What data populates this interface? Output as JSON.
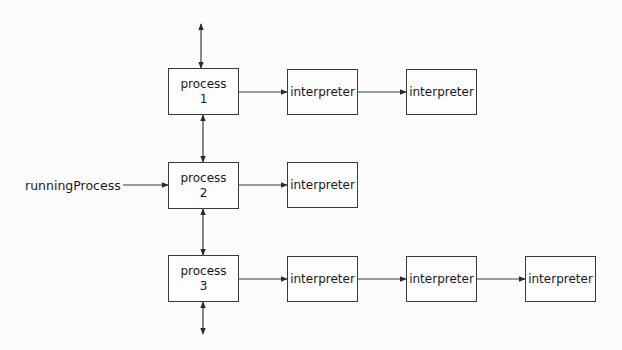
{
  "diagram": {
    "external_input": {
      "label": "runningProcess",
      "target": "process-2"
    },
    "processes": [
      {
        "id": "process-1",
        "title": "process",
        "number": "1",
        "interpreters": [
          "interpreter",
          "interpreter"
        ]
      },
      {
        "id": "process-2",
        "title": "process",
        "number": "2",
        "interpreters": [
          "interpreter"
        ]
      },
      {
        "id": "process-3",
        "title": "process",
        "number": "3",
        "interpreters": [
          "interpreter",
          "interpreter",
          "interpreter"
        ]
      }
    ],
    "links": [
      {
        "from": "above",
        "to": "process-1",
        "style": "bidirectional"
      },
      {
        "from": "process-1",
        "to": "process-2",
        "style": "bidirectional"
      },
      {
        "from": "process-2",
        "to": "process-3",
        "style": "bidirectional"
      },
      {
        "from": "process-3",
        "to": "below",
        "style": "bidirectional"
      },
      {
        "from": "runningProcess",
        "to": "process-2",
        "style": "directed"
      },
      {
        "from": "process-1",
        "to": "interpreter-1-1",
        "style": "directed"
      },
      {
        "from": "interpreter-1-1",
        "to": "interpreter-1-2",
        "style": "directed"
      },
      {
        "from": "process-2",
        "to": "interpreter-2-1",
        "style": "directed"
      },
      {
        "from": "process-3",
        "to": "interpreter-3-1",
        "style": "directed"
      },
      {
        "from": "interpreter-3-1",
        "to": "interpreter-3-2",
        "style": "directed"
      },
      {
        "from": "interpreter-3-2",
        "to": "interpreter-3-3",
        "style": "directed"
      }
    ],
    "colors": {
      "stroke": "#3a3a3a",
      "background": "#fcfcfc",
      "text": "#1a1a1a"
    }
  }
}
